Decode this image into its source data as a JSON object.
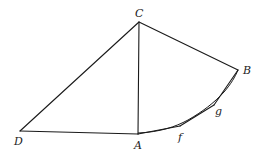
{
  "figure": {
    "points": {
      "A": {
        "label": "A",
        "x": 138,
        "y": 134,
        "label_x": 134,
        "label_y": 149
      },
      "B": {
        "label": "B",
        "x": 238,
        "y": 70,
        "label_x": 243,
        "label_y": 74
      },
      "C": {
        "label": "C",
        "x": 139,
        "y": 22,
        "label_x": 135,
        "label_y": 17
      },
      "D": {
        "label": "D",
        "x": 20,
        "y": 131,
        "label_x": 14,
        "label_y": 145
      },
      "f": {
        "label": "f",
        "x": 180,
        "y": 126,
        "label_x": 178,
        "label_y": 140
      },
      "g": {
        "label": "g",
        "x": 214,
        "y": 105,
        "label_x": 215,
        "label_y": 114
      }
    },
    "segments": [
      {
        "from": "C",
        "to": "D"
      },
      {
        "from": "C",
        "to": "A"
      },
      {
        "from": "C",
        "to": "B"
      },
      {
        "from": "D",
        "to": "A"
      },
      {
        "from": "A",
        "to": "f"
      },
      {
        "from": "f",
        "to": "g"
      },
      {
        "from": "g",
        "to": "B"
      }
    ],
    "arc": {
      "from": "A",
      "to": "B",
      "through": [
        "f",
        "g"
      ]
    }
  }
}
